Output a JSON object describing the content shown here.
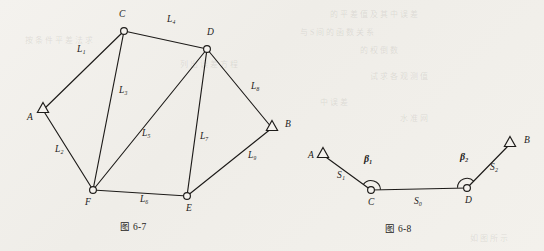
{
  "page": {
    "background_color": "#f2f0ec",
    "ink_color": "#1d1b19"
  },
  "figures": [
    {
      "id": "fig-6-7",
      "caption": "图 6-7",
      "type": "survey-network",
      "description": "Triangulation / trilateration network with two fixed control points and four unknown stations",
      "nodes": [
        {
          "id": "A",
          "label": "A",
          "marker": "triangle",
          "role": "control-point",
          "x": 43,
          "y": 110,
          "label_x": 27,
          "label_y": 120
        },
        {
          "id": "B",
          "label": "B",
          "marker": "triangle",
          "role": "control-point",
          "x": 272,
          "y": 128,
          "label_x": 285,
          "label_y": 127
        },
        {
          "id": "C",
          "label": "C",
          "marker": "circle",
          "role": "unknown-point",
          "x": 124,
          "y": 31,
          "label_x": 119,
          "label_y": 17
        },
        {
          "id": "D",
          "label": "D",
          "marker": "circle",
          "role": "unknown-point",
          "x": 207,
          "y": 49,
          "label_x": 207,
          "label_y": 35
        },
        {
          "id": "E",
          "label": "E",
          "marker": "circle",
          "role": "unknown-point",
          "x": 187,
          "y": 196,
          "label_x": 186,
          "label_y": 211
        },
        {
          "id": "F",
          "label": "F",
          "marker": "circle",
          "role": "unknown-point",
          "x": 93,
          "y": 190,
          "label_x": 85,
          "label_y": 205
        }
      ],
      "edges": [
        {
          "id": "L1",
          "label": "L₁",
          "from": "A",
          "to": "C",
          "label_x": 77,
          "label_y": 52
        },
        {
          "id": "L2",
          "label": "L₂",
          "from": "A",
          "to": "F",
          "label_x": 55,
          "label_y": 152
        },
        {
          "id": "L3",
          "label": "L₃",
          "from": "C",
          "to": "F",
          "label_x": 119,
          "label_y": 93
        },
        {
          "id": "L4",
          "label": "L₄",
          "from": "C",
          "to": "D",
          "label_x": 167,
          "label_y": 22
        },
        {
          "id": "L5",
          "label": "L₅",
          "from": "D",
          "to": "F",
          "label_x": 142,
          "label_y": 136
        },
        {
          "id": "L6",
          "label": "L₆",
          "from": "F",
          "to": "E",
          "label_x": 140,
          "label_y": 202
        },
        {
          "id": "L7",
          "label": "L₇",
          "from": "D",
          "to": "E",
          "label_x": 200,
          "label_y": 139
        },
        {
          "id": "L8",
          "label": "L₈",
          "from": "D",
          "to": "B",
          "label_x": 251,
          "label_y": 89
        },
        {
          "id": "L9",
          "label": "L₉",
          "from": "E",
          "to": "B",
          "label_x": 248,
          "label_y": 158
        }
      ]
    },
    {
      "id": "fig-6-8",
      "caption": "图 6-8",
      "type": "survey-traverse",
      "description": "Connecting traverse between two control points with two measured angles and three sides",
      "nodes": [
        {
          "id": "A",
          "label": "A",
          "marker": "triangle",
          "role": "control-point",
          "x": 323,
          "y": 155,
          "label_x": 308,
          "label_y": 158
        },
        {
          "id": "C",
          "label": "C",
          "marker": "circle",
          "role": "unknown-point",
          "x": 371,
          "y": 190,
          "label_x": 368,
          "label_y": 205
        },
        {
          "id": "D",
          "label": "D",
          "marker": "circle",
          "role": "unknown-point",
          "x": 467,
          "y": 188,
          "label_x": 465,
          "label_y": 203
        },
        {
          "id": "B",
          "label": "B",
          "marker": "triangle",
          "role": "control-point",
          "x": 510,
          "y": 144,
          "label_x": 524,
          "label_y": 143
        }
      ],
      "edges": [
        {
          "id": "S1",
          "label": "S₁",
          "from": "A",
          "to": "C",
          "label_x": 337,
          "label_y": 178
        },
        {
          "id": "S0",
          "label": "S₀",
          "from": "C",
          "to": "D",
          "label_x": 414,
          "label_y": 204
        },
        {
          "id": "S2",
          "label": "S₂",
          "from": "D",
          "to": "B",
          "label_x": 490,
          "label_y": 170
        }
      ],
      "angles": [
        {
          "id": "beta1",
          "label": "β₁",
          "at": "C",
          "label_x": 364,
          "label_y": 162
        },
        {
          "id": "beta2",
          "label": "β₂",
          "at": "D",
          "label_x": 460,
          "label_y": 160
        }
      ]
    }
  ],
  "ghost_text": [
    {
      "text": "的 平 差 值 及 其 中 误 差",
      "x": 330,
      "y": 8
    },
    {
      "text": "与 S 间 的 函 数 关 系",
      "x": 300,
      "y": 26
    },
    {
      "text": "按 条 件 平 差 法 求",
      "x": 25,
      "y": 34
    },
    {
      "text": "的 权 倒 数",
      "x": 360,
      "y": 44
    },
    {
      "text": "列 出 误 差 方 程",
      "x": 180,
      "y": 58
    },
    {
      "text": "试 求 各 观 测 值",
      "x": 370,
      "y": 70
    },
    {
      "text": "中 误 差",
      "x": 320,
      "y": 96
    },
    {
      "text": "水 准 网",
      "x": 400,
      "y": 112
    },
    {
      "text": "如 图 所 示",
      "x": 470,
      "y": 232
    }
  ]
}
